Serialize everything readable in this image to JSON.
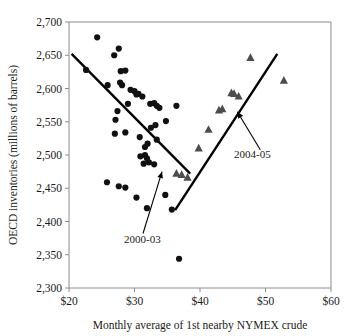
{
  "chart_data": {
    "type": "scatter",
    "title": "",
    "xlabel": "Monthly average of 1st nearby NYMEX crude",
    "ylabel": "OECD inventories (millions of barrels)",
    "xlim": [
      20,
      60
    ],
    "ylim": [
      2300,
      2700
    ],
    "xticks": [
      20,
      30,
      40,
      50,
      60
    ],
    "xtick_labels": [
      "$20",
      "$30",
      "$40",
      "$50",
      "$60"
    ],
    "yticks": [
      2300,
      2350,
      2400,
      2450,
      2500,
      2550,
      2600,
      2650,
      2700
    ],
    "ytick_labels": [
      "2,300",
      "2,350",
      "2,400",
      "2,450",
      "2,500",
      "2,550",
      "2,600",
      "2,650",
      "2,700"
    ],
    "grid": false,
    "legend": "none",
    "series": [
      {
        "name": "2000-03",
        "marker": "circle",
        "color": "#111111",
        "points": [
          [
            22.6,
            2628
          ],
          [
            24.3,
            2677
          ],
          [
            26.9,
            2650
          ],
          [
            27.6,
            2660
          ],
          [
            27.9,
            2626
          ],
          [
            28.6,
            2627
          ],
          [
            28.1,
            2605
          ],
          [
            25.9,
            2605
          ],
          [
            27.8,
            2609
          ],
          [
            29.4,
            2598
          ],
          [
            30.0,
            2596
          ],
          [
            30.3,
            2591
          ],
          [
            30.6,
            2592
          ],
          [
            31.2,
            2588
          ],
          [
            27.1,
            2553
          ],
          [
            27.4,
            2566
          ],
          [
            29.0,
            2577
          ],
          [
            32.4,
            2577
          ],
          [
            33.0,
            2578
          ],
          [
            33.4,
            2574
          ],
          [
            33.8,
            2571
          ],
          [
            36.4,
            2574
          ],
          [
            27.0,
            2532
          ],
          [
            28.6,
            2534
          ],
          [
            30.8,
            2527
          ],
          [
            32.5,
            2541
          ],
          [
            33.2,
            2545
          ],
          [
            34.8,
            2551
          ],
          [
            31.6,
            2512
          ],
          [
            32.0,
            2517
          ],
          [
            33.4,
            2523
          ],
          [
            30.9,
            2498
          ],
          [
            31.6,
            2500
          ],
          [
            31.9,
            2495
          ],
          [
            31.4,
            2487
          ],
          [
            32.2,
            2489
          ],
          [
            33.0,
            2486
          ],
          [
            25.8,
            2459
          ],
          [
            27.6,
            2453
          ],
          [
            28.6,
            2451
          ],
          [
            30.3,
            2436
          ],
          [
            31.9,
            2420
          ],
          [
            34.7,
            2440
          ],
          [
            35.7,
            2418
          ],
          [
            36.8,
            2344
          ]
        ]
      },
      {
        "name": "2004-05",
        "marker": "triangle",
        "color": "#4d4d4d",
        "points": [
          [
            38.1,
            2466
          ],
          [
            39.8,
            2510
          ],
          [
            41.3,
            2538
          ],
          [
            42.9,
            2567
          ],
          [
            43.4,
            2569
          ],
          [
            44.8,
            2593
          ],
          [
            45.2,
            2592
          ],
          [
            45.9,
            2588
          ],
          [
            47.7,
            2646
          ],
          [
            52.8,
            2612
          ],
          [
            36.4,
            2472
          ],
          [
            37.2,
            2470
          ]
        ]
      }
    ],
    "trend_lines": [
      {
        "name": "2000-03-trend",
        "slope_direction": "down",
        "x_start": 20.4,
        "y_start": 2652,
        "x_end": 38.5,
        "y_end": 2472
      },
      {
        "name": "2004-05-trend",
        "slope_direction": "up",
        "x_start": 36.2,
        "y_start": 2417,
        "x_end": 51.8,
        "y_end": 2652
      }
    ],
    "annotations": [
      {
        "name": "2000-03",
        "label": "2000-03",
        "label_x": 31.2,
        "label_y": 2368,
        "arrow_from_x": 31.3,
        "arrow_from_y": 2382,
        "arrow_to_x": 34.2,
        "arrow_to_y": 2475
      },
      {
        "name": "2004-05",
        "label": "2004-05",
        "label_x": 48.0,
        "label_y": 2495,
        "arrow_from_x": 49.2,
        "arrow_from_y": 2508,
        "arrow_to_x": 45.7,
        "arrow_to_y": 2565
      }
    ]
  },
  "colors": {
    "circle_marker": "#111111",
    "triangle_marker": "#4d4d4d",
    "trend_line": "#000000",
    "frame": "#8c8c8c",
    "text": "#1a1a1a",
    "background": "#ffffff"
  }
}
